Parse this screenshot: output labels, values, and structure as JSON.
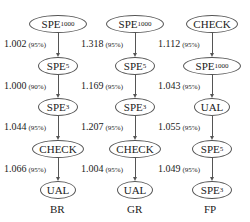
{
  "columns": [
    {
      "label": "BR",
      "nodes": [
        {
          "name": "SPE",
          "sub": "1000"
        },
        {
          "name": "SPE",
          "sub": "5"
        },
        {
          "name": "SPE",
          "sub": "3"
        },
        {
          "name": "CHECK",
          "sub": ""
        },
        {
          "name": "UAL",
          "sub": ""
        }
      ],
      "edges": [
        {
          "value": "1.002",
          "conf": "(95%)"
        },
        {
          "value": "1.000",
          "conf": "(90%)"
        },
        {
          "value": "1.044",
          "conf": "(95%)"
        },
        {
          "value": "1.066",
          "conf": "(95%)"
        }
      ]
    },
    {
      "label": "GR",
      "nodes": [
        {
          "name": "SPE",
          "sub": "1000"
        },
        {
          "name": "SPE",
          "sub": "5"
        },
        {
          "name": "SPE",
          "sub": "3"
        },
        {
          "name": "CHECK",
          "sub": ""
        },
        {
          "name": "UAL",
          "sub": ""
        }
      ],
      "edges": [
        {
          "value": "1.318",
          "conf": "(95%)"
        },
        {
          "value": "1.169",
          "conf": "(95%)"
        },
        {
          "value": "1.207",
          "conf": "(95%)"
        },
        {
          "value": "1.004",
          "conf": "(95%)"
        }
      ]
    },
    {
      "label": "FP",
      "nodes": [
        {
          "name": "CHECK",
          "sub": ""
        },
        {
          "name": "SPE",
          "sub": "1000"
        },
        {
          "name": "UAL",
          "sub": ""
        },
        {
          "name": "SPE",
          "sub": "5"
        },
        {
          "name": "SPE",
          "sub": "3"
        }
      ],
      "edges": [
        {
          "value": "1.112",
          "conf": "(95%)"
        },
        {
          "value": "1.043",
          "conf": "(95%)"
        },
        {
          "value": "1.055",
          "conf": "(95%)"
        },
        {
          "value": "1.049",
          "conf": "(95%)"
        }
      ]
    }
  ]
}
